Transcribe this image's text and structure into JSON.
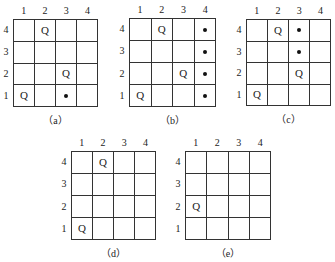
{
  "diagram": {
    "col_labels": [
      "1",
      "2",
      "3",
      "4"
    ],
    "row_labels_top_to_bottom": [
      "4",
      "3",
      "2",
      "1"
    ],
    "queen_symbol": "Q",
    "boards": [
      {
        "id": "a",
        "caption": "（a）",
        "box": {
          "x": 13,
          "y": 19,
          "w": 85,
          "h": 88
        },
        "cells": [
          [
            "",
            "Q",
            "",
            ""
          ],
          [
            "",
            "",
            "",
            ""
          ],
          [
            "",
            "",
            "Q",
            ""
          ],
          [
            "Q",
            "",
            "dot",
            ""
          ]
        ]
      },
      {
        "id": "b",
        "caption": "（b）",
        "box": {
          "x": 129,
          "y": 18,
          "w": 87,
          "h": 89
        },
        "cells": [
          [
            "",
            "Q",
            "",
            "dot"
          ],
          [
            "",
            "",
            "",
            "dot"
          ],
          [
            "",
            "",
            "Q",
            "dot"
          ],
          [
            "Q",
            "",
            "",
            "dot"
          ]
        ]
      },
      {
        "id": "c",
        "caption": "（c）",
        "box": {
          "x": 246,
          "y": 19,
          "w": 85,
          "h": 87
        },
        "cells": [
          [
            "",
            "Q",
            "dot",
            ""
          ],
          [
            "",
            "",
            "dot",
            ""
          ],
          [
            "",
            "",
            "Q",
            ""
          ],
          [
            "Q",
            "",
            "",
            ""
          ]
        ]
      },
      {
        "id": "d",
        "caption": "（d）",
        "box": {
          "x": 71,
          "y": 151,
          "w": 85,
          "h": 89
        },
        "cells": [
          [
            "",
            "Q",
            "",
            ""
          ],
          [
            "",
            "",
            "",
            ""
          ],
          [
            "",
            "",
            "",
            ""
          ],
          [
            "Q",
            "",
            "",
            ""
          ]
        ]
      },
      {
        "id": "e",
        "caption": "（e）",
        "box": {
          "x": 185,
          "y": 151,
          "w": 86,
          "h": 89
        },
        "cells": [
          [
            "",
            "",
            "",
            ""
          ],
          [
            "",
            "",
            "",
            ""
          ],
          [
            "Q",
            "",
            "",
            ""
          ],
          [
            "",
            "",
            "",
            ""
          ]
        ]
      }
    ]
  }
}
